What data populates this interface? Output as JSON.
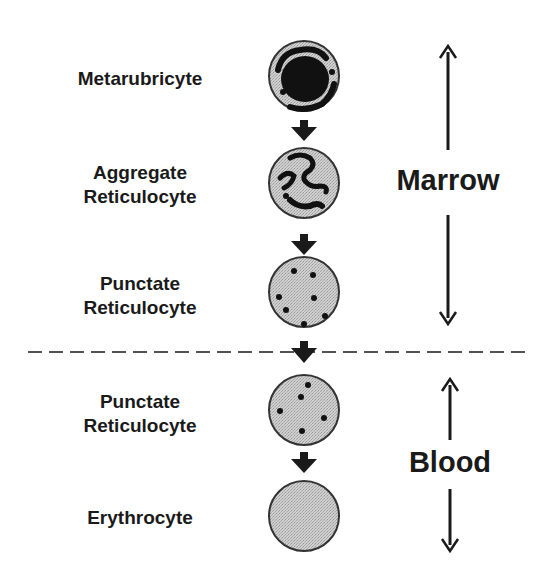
{
  "diagram": {
    "stages": [
      {
        "id": "metarubricyte",
        "label_lines": [
          "Metarubricyte"
        ],
        "cell_type": "nucleated",
        "zone": "Marrow"
      },
      {
        "id": "aggregate-reticulocyte",
        "label_lines": [
          "Aggregate",
          "Reticulocyte"
        ],
        "cell_type": "aggregate-reticulum",
        "zone": "Marrow"
      },
      {
        "id": "punctate-reticulocyte-marrow",
        "label_lines": [
          "Punctate",
          "Reticulocyte"
        ],
        "cell_type": "punctate-dots",
        "zone": "Marrow"
      },
      {
        "id": "punctate-reticulocyte-blood",
        "label_lines": [
          "Punctate",
          "Reticulocyte"
        ],
        "cell_type": "punctate-dots-few",
        "zone": "Blood"
      },
      {
        "id": "erythrocyte",
        "label_lines": [
          "Erythrocyte"
        ],
        "cell_type": "mature",
        "zone": "Blood"
      }
    ],
    "zones": [
      {
        "name": "Marrow",
        "label": "Marrow"
      },
      {
        "name": "Blood",
        "label": "Blood"
      }
    ],
    "divider": {
      "style": "dashed",
      "meaning": "marrow-blood boundary"
    },
    "colors": {
      "cell_fill": "#c8c8c8",
      "cell_outline": "#333333",
      "inclusion": "#111111",
      "text": "#1a1a1a",
      "background": "#ffffff"
    }
  },
  "labels": {
    "s0_l0": "Metarubricyte",
    "s1_l0": "Aggregate",
    "s1_l1": "Reticulocyte",
    "s2_l0": "Punctate",
    "s2_l1": "Reticulocyte",
    "s3_l0": "Punctate",
    "s3_l1": "Reticulocyte",
    "s4_l0": "Erythrocyte",
    "zone_marrow": "Marrow",
    "zone_blood": "Blood"
  }
}
